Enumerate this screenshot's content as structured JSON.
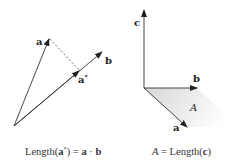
{
  "left_panel": {
    "labels": {
      "a": "a",
      "b": "b",
      "a_star": "a",
      "a_star_sup": "*"
    },
    "caption": {
      "prefix": "Length(",
      "vec": "a",
      "sup": "*",
      "mid": ") = ",
      "a": "a",
      "dot": " · ",
      "b": "b"
    },
    "colors": {
      "stroke": "#333333",
      "dashed": "#555555"
    }
  },
  "right_panel": {
    "labels": {
      "c": "c",
      "b": "b",
      "a": "a",
      "area": "A"
    },
    "caption": {
      "area": "A",
      "mid": " = Length(",
      "vec": "c",
      "end": ")"
    },
    "colors": {
      "stroke": "#333333",
      "fill_start": "#d8d8d8",
      "fill_end": "#ffffff"
    }
  }
}
